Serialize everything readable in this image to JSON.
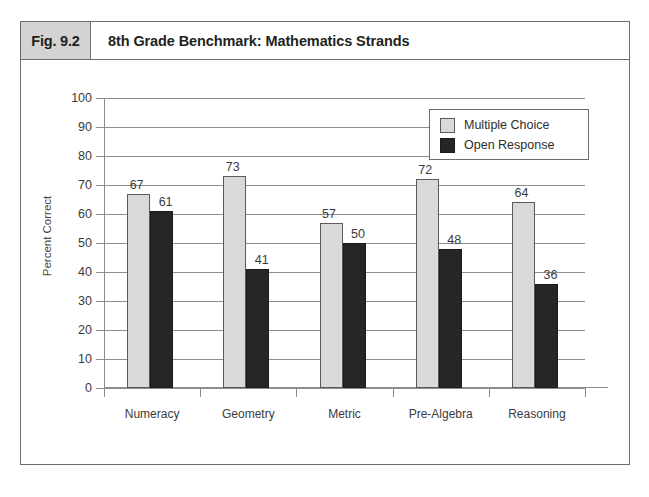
{
  "figure": {
    "number": "Fig. 9.2",
    "title": "8th Grade Benchmark: Mathematics Strands"
  },
  "legend": {
    "entries": [
      {
        "label": "Multiple Choice",
        "color": "#d9d9d9"
      },
      {
        "label": "Open Response",
        "color": "#262626"
      }
    ]
  },
  "chart_data": {
    "type": "bar",
    "title": "8th Grade Benchmark: Mathematics Strands",
    "xlabel": "",
    "ylabel": "Percent Correct",
    "ylim": [
      0,
      100
    ],
    "yticks": [
      0,
      10,
      20,
      30,
      40,
      50,
      60,
      70,
      80,
      90,
      100
    ],
    "ytick_labels": [
      "0",
      "10",
      "20",
      "30",
      "40",
      "50",
      "60",
      "70",
      "80",
      "90",
      "100"
    ],
    "grid": true,
    "legend_position": "top-right",
    "categories": [
      "Numeracy",
      "Geometry",
      "Metric",
      "Pre-Algebra",
      "Reasoning"
    ],
    "series": [
      {
        "name": "Multiple Choice",
        "color": "#d9d9d9",
        "values": [
          67,
          73,
          57,
          72,
          64
        ]
      },
      {
        "name": "Open Response",
        "color": "#262626",
        "values": [
          61,
          41,
          50,
          48,
          36
        ]
      }
    ]
  }
}
